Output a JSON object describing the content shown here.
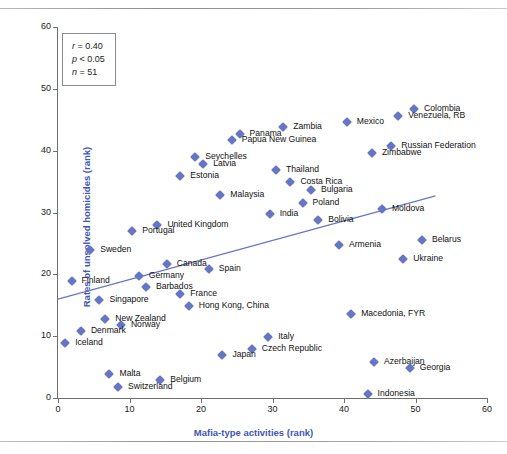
{
  "figure": {
    "ghost_header": "",
    "ghost_footer": ""
  },
  "stats": {
    "r_label": "r",
    "r_op": "=",
    "r_value": "0.40",
    "p_label": "p",
    "p_op": "<",
    "p_value": "0.05",
    "n_label": "n",
    "n_op": "=",
    "n_value": "51"
  },
  "chart_data": {
    "type": "scatter",
    "title": "",
    "xlabel": "Mafia-type activities (rank)",
    "ylabel": "Rates of unsolved homicides (rank)",
    "xlim": [
      0,
      60
    ],
    "ylim": [
      0,
      60
    ],
    "xticks": [
      "0",
      "10",
      "20",
      "30",
      "40",
      "50",
      "60"
    ],
    "yticks": [
      "0",
      "10",
      "20",
      "30",
      "40",
      "50",
      "60"
    ],
    "xtick_values": [
      0,
      10,
      20,
      30,
      40,
      50,
      60
    ],
    "ytick_values": [
      0,
      10,
      20,
      30,
      40,
      50,
      60
    ],
    "grid": false,
    "legend": "none",
    "marker_color": "#6776c4",
    "trendline_color": "#6776c4",
    "annotations": [
      "r = 0.40",
      "p < 0.05",
      "n = 51"
    ],
    "trendline": {
      "x0": 0,
      "y0": 16.0,
      "x1": 52.8,
      "y1": 32.7
    },
    "points": [
      {
        "label": "Colombia",
        "x": 49.8,
        "y": 46.8,
        "side": "right"
      },
      {
        "label": "Venezuela, RB",
        "x": 47.6,
        "y": 45.6,
        "side": "right"
      },
      {
        "label": "Mexico",
        "x": 40.4,
        "y": 44.6,
        "side": "right"
      },
      {
        "label": "Zambia",
        "x": 31.5,
        "y": 43.9,
        "side": "right"
      },
      {
        "label": "Panama",
        "x": 25.4,
        "y": 42.7,
        "side": "right"
      },
      {
        "label": "Papua New Guinea",
        "x": 24.3,
        "y": 41.8,
        "side": "right"
      },
      {
        "label": "Russian Federation",
        "x": 46.6,
        "y": 40.8,
        "side": "right"
      },
      {
        "label": "Zimbabwe",
        "x": 43.9,
        "y": 39.7,
        "side": "right"
      },
      {
        "label": "Seychelles",
        "x": 19.2,
        "y": 38.9,
        "side": "right"
      },
      {
        "label": "Latvia",
        "x": 20.3,
        "y": 37.8,
        "side": "right"
      },
      {
        "label": "Thailand",
        "x": 30.5,
        "y": 36.8,
        "side": "right"
      },
      {
        "label": "Estonia",
        "x": 17.1,
        "y": 35.9,
        "side": "right"
      },
      {
        "label": "Costa Rica",
        "x": 32.5,
        "y": 34.9,
        "side": "right"
      },
      {
        "label": "Bulgaria",
        "x": 35.4,
        "y": 33.7,
        "side": "right"
      },
      {
        "label": "Malaysia",
        "x": 22.7,
        "y": 32.8,
        "side": "right"
      },
      {
        "label": "Poland",
        "x": 34.2,
        "y": 31.6,
        "side": "right"
      },
      {
        "label": "Moldova",
        "x": 45.3,
        "y": 30.6,
        "side": "right"
      },
      {
        "label": "India",
        "x": 29.6,
        "y": 29.8,
        "side": "right"
      },
      {
        "label": "Bolivia",
        "x": 36.4,
        "y": 28.8,
        "side": "right"
      },
      {
        "label": "United Kingdom",
        "x": 13.9,
        "y": 28.0,
        "side": "right"
      },
      {
        "label": "Portugal",
        "x": 10.4,
        "y": 27.0,
        "side": "right"
      },
      {
        "label": "Belarus",
        "x": 50.9,
        "y": 25.6,
        "side": "right"
      },
      {
        "label": "Armenia",
        "x": 39.3,
        "y": 24.7,
        "side": "right"
      },
      {
        "label": "Sweden",
        "x": 4.5,
        "y": 23.9,
        "side": "right"
      },
      {
        "label": "Ukraine",
        "x": 48.3,
        "y": 22.4,
        "side": "right"
      },
      {
        "label": "Canada",
        "x": 15.2,
        "y": 21.7,
        "side": "right"
      },
      {
        "label": "Spain",
        "x": 21.1,
        "y": 20.8,
        "side": "right"
      },
      {
        "label": "Germany",
        "x": 11.3,
        "y": 19.8,
        "side": "right"
      },
      {
        "label": "Finland",
        "x": 1.9,
        "y": 19.0,
        "side": "right"
      },
      {
        "label": "Barbados",
        "x": 12.3,
        "y": 18.0,
        "side": "right"
      },
      {
        "label": "France",
        "x": 17.1,
        "y": 16.9,
        "side": "right"
      },
      {
        "label": "Singapore",
        "x": 5.8,
        "y": 15.9,
        "side": "right"
      },
      {
        "label": "Hong Kong, China",
        "x": 18.3,
        "y": 14.8,
        "side": "right"
      },
      {
        "label": "Macedonia, FYR",
        "x": 41.0,
        "y": 13.6,
        "side": "right"
      },
      {
        "label": "New Zealand",
        "x": 6.6,
        "y": 12.8,
        "side": "right"
      },
      {
        "label": "Norway",
        "x": 8.8,
        "y": 11.8,
        "side": "right"
      },
      {
        "label": "Denmark",
        "x": 3.2,
        "y": 10.8,
        "side": "right"
      },
      {
        "label": "Italy",
        "x": 29.4,
        "y": 9.8,
        "side": "right"
      },
      {
        "label": "Iceland",
        "x": 1.0,
        "y": 8.9,
        "side": "right"
      },
      {
        "label": "Czech Republic",
        "x": 27.1,
        "y": 7.9,
        "side": "right"
      },
      {
        "label": "Japan",
        "x": 23.0,
        "y": 6.9,
        "side": "right"
      },
      {
        "label": "Azerbaijan",
        "x": 44.2,
        "y": 5.8,
        "side": "right"
      },
      {
        "label": "Georgia",
        "x": 49.2,
        "y": 4.8,
        "side": "right"
      },
      {
        "label": "Malta",
        "x": 7.2,
        "y": 3.9,
        "side": "right"
      },
      {
        "label": "Belgium",
        "x": 14.3,
        "y": 2.9,
        "side": "right"
      },
      {
        "label": "Switzerland",
        "x": 8.4,
        "y": 1.8,
        "side": "right"
      },
      {
        "label": "Indonesia",
        "x": 43.3,
        "y": 0.7,
        "side": "right"
      }
    ]
  }
}
